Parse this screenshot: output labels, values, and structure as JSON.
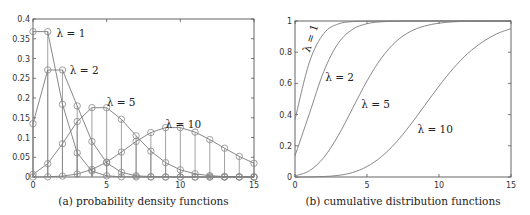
{
  "chart_data": [
    {
      "type": "line",
      "title": "",
      "caption": "(a) probability density functions",
      "xlabel": "",
      "ylabel": "",
      "xlim": [
        0,
        15
      ],
      "ylim": [
        0,
        0.4
      ],
      "xticks": [
        0,
        5,
        10,
        15
      ],
      "yticks": [
        0,
        0.05,
        0.1,
        0.15,
        0.2,
        0.25,
        0.3,
        0.35,
        0.4
      ],
      "ytick_labels": [
        "0",
        "0.05",
        "0.1",
        "0.15",
        "0.2",
        "0.25",
        "0.3",
        "0.35",
        "0.4"
      ],
      "grid": false,
      "markers": "circle",
      "stems": true,
      "x": [
        0,
        1,
        2,
        3,
        4,
        5,
        6,
        7,
        8,
        9,
        10,
        11,
        12,
        13,
        14,
        15
      ],
      "series": [
        {
          "name": "λ = 1",
          "values": [
            0.368,
            0.368,
            0.184,
            0.061,
            0.015,
            0.003,
            0.0005,
            0.0001,
            0,
            0,
            0,
            0,
            0,
            0,
            0,
            0
          ]
        },
        {
          "name": "λ = 2",
          "values": [
            0.135,
            0.271,
            0.271,
            0.18,
            0.09,
            0.036,
            0.012,
            0.003,
            0.0009,
            0.0002,
            0,
            0,
            0,
            0,
            0,
            0
          ]
        },
        {
          "name": "λ = 5",
          "values": [
            0.0067,
            0.0337,
            0.0842,
            0.1404,
            0.1755,
            0.1755,
            0.1462,
            0.1044,
            0.0653,
            0.0363,
            0.0181,
            0.0082,
            0.0034,
            0.0013,
            0.0005,
            0.0002
          ]
        },
        {
          "name": "λ = 10",
          "values": [
            5e-05,
            0.0005,
            0.0023,
            0.0076,
            0.0189,
            0.0378,
            0.0631,
            0.0901,
            0.1126,
            0.1251,
            0.1251,
            0.1137,
            0.0948,
            0.0729,
            0.0521,
            0.0347
          ]
        }
      ],
      "annotations": [
        {
          "text": "λ = 1",
          "x": 1.6,
          "y": 0.365
        },
        {
          "text": "λ = 2",
          "x": 2.5,
          "y": 0.27
        },
        {
          "text": "λ = 5",
          "x": 5.0,
          "y": 0.19
        },
        {
          "text": "λ = 10",
          "x": 9.0,
          "y": 0.135
        }
      ]
    },
    {
      "type": "line",
      "title": "",
      "caption": "(b) cumulative distribution functions",
      "xlabel": "",
      "ylabel": "",
      "xlim": [
        0,
        15
      ],
      "ylim": [
        0,
        1
      ],
      "xticks": [
        0,
        5,
        10,
        15
      ],
      "yticks": [
        0,
        0.2,
        0.4,
        0.6,
        0.8,
        1
      ],
      "ytick_labels": [
        "0",
        "0.2",
        "0.4",
        "0.6",
        "0.8",
        "1"
      ],
      "grid": false,
      "x": [
        0,
        1,
        2,
        3,
        4,
        5,
        6,
        7,
        8,
        9,
        10,
        11,
        12,
        13,
        14,
        15
      ],
      "series": [
        {
          "name": "λ = 1",
          "values": [
            0.368,
            0.736,
            0.92,
            0.981,
            0.996,
            0.999,
            1,
            1,
            1,
            1,
            1,
            1,
            1,
            1,
            1,
            1
          ]
        },
        {
          "name": "λ = 2",
          "values": [
            0.135,
            0.406,
            0.677,
            0.857,
            0.947,
            0.983,
            0.995,
            0.999,
            1,
            1,
            1,
            1,
            1,
            1,
            1,
            1
          ]
        },
        {
          "name": "λ = 5",
          "values": [
            0.007,
            0.04,
            0.125,
            0.265,
            0.44,
            0.616,
            0.762,
            0.867,
            0.932,
            0.968,
            0.986,
            0.995,
            0.998,
            0.999,
            1,
            1
          ]
        },
        {
          "name": "λ = 10",
          "values": [
            0,
            0.0005,
            0.003,
            0.01,
            0.029,
            0.067,
            0.13,
            0.22,
            0.333,
            0.458,
            0.583,
            0.697,
            0.792,
            0.864,
            0.917,
            0.951
          ]
        }
      ],
      "annotations": [
        {
          "text": "λ = 1",
          "x": 1.0,
          "y": 0.82,
          "rotation": -72
        },
        {
          "text": "λ = 2",
          "x": 2.1,
          "y": 0.64
        },
        {
          "text": "λ = 5",
          "x": 4.6,
          "y": 0.47
        },
        {
          "text": "λ = 10",
          "x": 8.5,
          "y": 0.31
        }
      ]
    }
  ]
}
